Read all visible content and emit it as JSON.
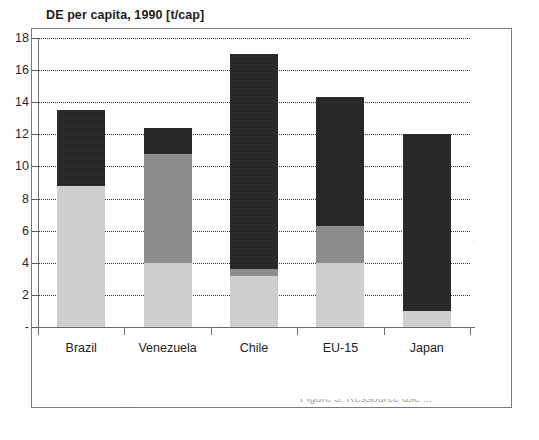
{
  "chart_data": {
    "type": "bar",
    "title": "DE per capita, 1990 [t/cap]",
    "xlabel": "",
    "ylabel": "",
    "ylim": [
      0,
      18
    ],
    "yticks": [
      "-",
      "2",
      "4",
      "6",
      "8",
      "10",
      "12",
      "14",
      "16",
      "18"
    ],
    "ytick_values": [
      0,
      2,
      4,
      6,
      8,
      10,
      12,
      14,
      16,
      18
    ],
    "grid": true,
    "stacked": true,
    "legend": "none",
    "categories": [
      "Brazil",
      "Venezuela",
      "Chile",
      "EU-15",
      "Japan"
    ],
    "series": [
      {
        "name": "light-gray-segment",
        "color": "#d3d3d3",
        "values": [
          8.8,
          4.0,
          3.2,
          4.0,
          1.0
        ]
      },
      {
        "name": "medium-gray-segment",
        "color": "#8c8c8c",
        "values": [
          0.0,
          6.8,
          0.4,
          2.3,
          0.0
        ]
      },
      {
        "name": "dark-segment",
        "color": "#232323",
        "values": [
          4.7,
          1.6,
          13.4,
          8.0,
          11.0
        ]
      }
    ],
    "totals": [
      13.5,
      12.4,
      17.0,
      14.3,
      12.0
    ]
  },
  "cut_caption": "Figure 5: Ressource use ..."
}
